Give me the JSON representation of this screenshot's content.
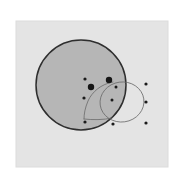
{
  "canvas": {
    "width": 185,
    "height": 183,
    "page_background": "#ffffff"
  },
  "panel": {
    "label": "plot-panel",
    "x": 16,
    "y": 21,
    "width": 152,
    "height": 146,
    "fill": "#e4e4e4",
    "stroke": "#dcdcdc"
  },
  "chart_data": {
    "type": "scatter",
    "title": "",
    "subtitle": "",
    "xlabel": "",
    "ylabel": "",
    "grid": false,
    "legend": null,
    "axis_visible": false,
    "tick_labels": [],
    "xlim": [
      16,
      168
    ],
    "ylim": [
      21,
      167
    ],
    "shapes": [
      {
        "name": "main-disk",
        "kind": "circle",
        "cx": 81,
        "cy": 85,
        "r": 45,
        "fill": "#b6b6b6",
        "stroke": "#2e2e2e",
        "stroke_width": 1.5
      },
      {
        "name": "overlay-ellipse",
        "kind": "ellipse",
        "cx": 122,
        "cy": 102,
        "rx": 22,
        "ry": 20,
        "rotation": -8,
        "fill": "none",
        "stroke": "#6a6a6a",
        "stroke_width": 0.8
      },
      {
        "name": "interior-arc",
        "kind": "path",
        "d": "M 113 82 C 101 84, 92 92, 88 101 C 85 108, 84 114, 84 119",
        "fill": "none",
        "stroke": "#6a6a6a",
        "stroke_width": 0.8
      },
      {
        "name": "arc-tail",
        "kind": "path",
        "d": "M 84 119 C 93 120, 103 120, 112 118",
        "fill": "none",
        "stroke": "#6a6a6a",
        "stroke_width": 0.8
      }
    ],
    "points": [
      {
        "id": "p1",
        "x": 85,
        "y": 79,
        "r": 1.6,
        "color": "#1b1b1b",
        "size_class": "small",
        "region": "inside-disk"
      },
      {
        "id": "p2",
        "x": 91,
        "y": 87,
        "r": 3.2,
        "color": "#161616",
        "size_class": "large",
        "region": "inside-disk"
      },
      {
        "id": "p3",
        "x": 109,
        "y": 80,
        "r": 3.2,
        "color": "#161616",
        "size_class": "large",
        "region": "inside-disk"
      },
      {
        "id": "p4",
        "x": 116,
        "y": 87,
        "r": 1.5,
        "color": "#1b1b1b",
        "size_class": "small",
        "region": "inside-disk"
      },
      {
        "id": "p5",
        "x": 84,
        "y": 98,
        "r": 1.6,
        "color": "#1b1b1b",
        "size_class": "small",
        "region": "inside-disk"
      },
      {
        "id": "p6",
        "x": 112,
        "y": 100,
        "r": 1.5,
        "color": "#1b1b1b",
        "size_class": "small",
        "region": "inside-disk"
      },
      {
        "id": "p7",
        "x": 85,
        "y": 122,
        "r": 1.6,
        "color": "#1b1b1b",
        "size_class": "small",
        "region": "inside-disk"
      },
      {
        "id": "p8",
        "x": 113,
        "y": 124,
        "r": 1.6,
        "color": "#1b1b1b",
        "size_class": "small",
        "region": "outside-disk"
      },
      {
        "id": "p9",
        "x": 146,
        "y": 84,
        "r": 1.6,
        "color": "#1b1b1b",
        "size_class": "small",
        "region": "outside-disk"
      },
      {
        "id": "p10",
        "x": 146,
        "y": 102,
        "r": 1.6,
        "color": "#1b1b1b",
        "size_class": "small",
        "region": "outside-disk"
      },
      {
        "id": "p11",
        "x": 146,
        "y": 123,
        "r": 1.6,
        "color": "#1b1b1b",
        "size_class": "small",
        "region": "outside-disk"
      }
    ],
    "point_count": 11,
    "large_point_count": 2,
    "small_point_count": 9
  }
}
